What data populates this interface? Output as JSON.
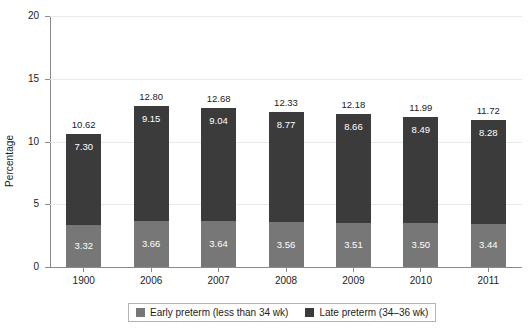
{
  "chart_data": {
    "type": "bar",
    "subtype": "stacked-bar",
    "title": "",
    "xlabel": "",
    "ylabel": "Percentage",
    "ylim": [
      0,
      20
    ],
    "yticks": [
      0,
      5,
      10,
      15,
      20
    ],
    "grid": true,
    "legend_position": "bottom",
    "categories": [
      "1900",
      "2006",
      "2007",
      "2008",
      "2009",
      "2010",
      "2011"
    ],
    "series": [
      {
        "name": "Early preterm (less than 34 wk)",
        "color": "#777777",
        "values": [
          3.32,
          3.66,
          3.64,
          3.56,
          3.51,
          3.5,
          3.44
        ]
      },
      {
        "name": "Late preterm (34–36 wk)",
        "color": "#3b3b3b",
        "values": [
          7.3,
          9.15,
          9.04,
          8.77,
          8.66,
          8.49,
          8.28
        ]
      }
    ],
    "totals": [
      10.62,
      12.8,
      12.68,
      12.33,
      12.18,
      11.99,
      11.72
    ],
    "value_labels": {
      "early": [
        "3.32",
        "3.66",
        "3.64",
        "3.56",
        "3.51",
        "3.50",
        "3.44"
      ],
      "late": [
        "7.30",
        "9.15",
        "9.04",
        "8.77",
        "8.66",
        "8.49",
        "8.28"
      ],
      "total": [
        "10.62",
        "12.80",
        "12.68",
        "12.33",
        "12.18",
        "11.99",
        "11.72"
      ]
    },
    "ytick_labels": [
      "0",
      "5",
      "10",
      "15",
      "20"
    ]
  },
  "legend": {
    "items": [
      {
        "label": "Early preterm (less than 34 wk)",
        "color": "#777777"
      },
      {
        "label": "Late preterm (34–36 wk)",
        "color": "#3b3b3b"
      }
    ]
  },
  "colors": {
    "early": "#777777",
    "late": "#3b3b3b",
    "grid": "#e9e9e9",
    "axis": "#8a8a8a",
    "text": "#1c1c1c",
    "background": "#ffffff"
  }
}
